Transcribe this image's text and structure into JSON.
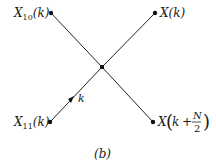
{
  "diagram": {
    "type": "butterfly-flow-graph",
    "caption": "(b)",
    "nodes": {
      "top_left": {
        "label_main": "X",
        "label_sub": "10",
        "label_arg": "(k)"
      },
      "top_right": {
        "label_main": "X",
        "label_arg": "(k)"
      },
      "center": {},
      "bottom_left": {
        "label_main": "X",
        "label_sub": "11",
        "label_arg": "(k)"
      },
      "bottom_right": {
        "label_main": "X",
        "label_open": "(",
        "label_k": "k",
        "label_plus": "+",
        "label_num": "N",
        "label_den": "2",
        "label_close": ")"
      }
    },
    "branch_gain": "k",
    "colors": {
      "line": "#222222",
      "node": "#111111",
      "text": "#1a1a1a"
    }
  }
}
